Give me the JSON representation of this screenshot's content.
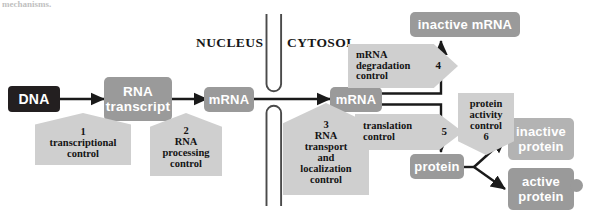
{
  "figure": {
    "cropped_caption": "mechanisms.",
    "compartments": [
      {
        "id": "nucleus",
        "label": "NUCLEUS"
      },
      {
        "id": "cytosol",
        "label": "CYTOSOL"
      }
    ],
    "species": [
      {
        "id": "dna",
        "label": "DNA",
        "style": "dark"
      },
      {
        "id": "rna-transcript",
        "label": "RNA\ntranscript",
        "line1": "RNA",
        "line2": "transcript",
        "style": "grey"
      },
      {
        "id": "mrna-nuclear",
        "label": "mRNA",
        "style": "grey"
      },
      {
        "id": "mrna-cytosolic",
        "label": "mRNA",
        "style": "grey"
      },
      {
        "id": "inactive-mrna",
        "label": "inactive mRNA",
        "style": "grey"
      },
      {
        "id": "protein",
        "label": "protein",
        "style": "grey"
      },
      {
        "id": "inactive-protein",
        "line1": "inactive",
        "line2": "protein",
        "style": "lightgrey"
      },
      {
        "id": "active-protein",
        "line1": "active",
        "line2": "protein",
        "style": "grey"
      }
    ],
    "controls": [
      {
        "id": "transcriptional-control",
        "number": "1",
        "lines": [
          "transcriptional",
          "control"
        ],
        "shape": "pentagon-up"
      },
      {
        "id": "rna-processing-control",
        "number": "2",
        "lines": [
          "RNA",
          "processing",
          "control"
        ],
        "shape": "pentagon-up"
      },
      {
        "id": "rna-transport-and-localization-control",
        "number": "3",
        "lines": [
          "RNA",
          "transport",
          "and",
          "localization",
          "control"
        ],
        "shape": "pentagon-up"
      },
      {
        "id": "mrna-degradation-control",
        "number": "4",
        "lines": [
          "mRNA",
          "degradation",
          "control"
        ],
        "shape": "arrow-right"
      },
      {
        "id": "translation-control",
        "number": "5",
        "lines": [
          "translation",
          "control"
        ],
        "shape": "arrow-right"
      },
      {
        "id": "protein-activity-control",
        "number": "6",
        "lines": [
          "protein",
          "activity",
          "control"
        ],
        "shape": "pentagon-down"
      }
    ],
    "colors": {
      "dna_box": "#231f20",
      "species_box": "#9a9a9a",
      "species_box_light": "#b3b3b3",
      "control_box": "#cfcfcf",
      "arrow": "#1a1a1a",
      "membrane": "#4a4a4a",
      "text_on_box": "#ffffff",
      "text_dark": "#141414",
      "background": "#ffffff"
    }
  }
}
